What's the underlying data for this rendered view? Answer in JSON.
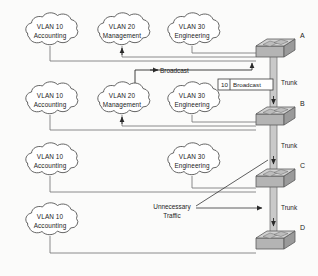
{
  "diagram": {
    "type": "network-topology",
    "background_color": "#fbfbfa",
    "line_color": "#6f6f6f",
    "accent_color": "#2a2a2a"
  },
  "clouds": [
    {
      "id": "c-r1-vlan10",
      "vlan": "VLAN 10",
      "name": "Accounting",
      "row": 1,
      "cx": 50,
      "cy": 32
    },
    {
      "id": "c-r1-vlan20",
      "vlan": "VLAN 20",
      "name": "Management",
      "row": 1,
      "cx": 122,
      "cy": 32
    },
    {
      "id": "c-r1-vlan30",
      "vlan": "VLAN 30",
      "name": "Engineering",
      "row": 1,
      "cx": 192,
      "cy": 32
    },
    {
      "id": "c-r2-vlan10",
      "vlan": "VLAN 10",
      "name": "Accounting",
      "row": 2,
      "cx": 50,
      "cy": 101
    },
    {
      "id": "c-r2-vlan20",
      "vlan": "VLAN 20",
      "name": "Management",
      "row": 2,
      "cx": 122,
      "cy": 101
    },
    {
      "id": "c-r2-vlan30",
      "vlan": "VLAN 30",
      "name": "Engineering",
      "row": 2,
      "cx": 192,
      "cy": 101
    },
    {
      "id": "c-r3-vlan10",
      "vlan": "VLAN 10",
      "name": "Accounting",
      "row": 3,
      "cx": 50,
      "cy": 162
    },
    {
      "id": "c-r3-vlan30",
      "vlan": "VLAN 30",
      "name": "Engineering",
      "row": 3,
      "cx": 192,
      "cy": 162
    },
    {
      "id": "c-r4-vlan10",
      "vlan": "VLAN 10",
      "name": "Accounting",
      "row": 4,
      "cx": 50,
      "cy": 222
    }
  ],
  "switches": [
    {
      "id": "sw-a",
      "label": "A",
      "x": 262,
      "y": 34
    },
    {
      "id": "sw-b",
      "label": "B",
      "x": 262,
      "y": 108
    },
    {
      "id": "sw-c",
      "label": "C",
      "x": 262,
      "y": 170
    },
    {
      "id": "sw-d",
      "label": "D",
      "x": 262,
      "y": 232
    }
  ],
  "trunks": [
    {
      "id": "trunk-ab",
      "label": "Trunk",
      "from": "A",
      "to": "B"
    },
    {
      "id": "trunk-bc",
      "label": "Trunk",
      "from": "B",
      "to": "C"
    },
    {
      "id": "trunk-cd",
      "label": "Trunk",
      "from": "C",
      "to": "D"
    }
  ],
  "annotations": {
    "broadcast_flow_label": "Broadcast",
    "tag_vlan_id": "10",
    "tag_frame_label": "Broadcast",
    "unnecessary_line1": "Unnecessary",
    "unnecessary_line2": "Traffic"
  }
}
